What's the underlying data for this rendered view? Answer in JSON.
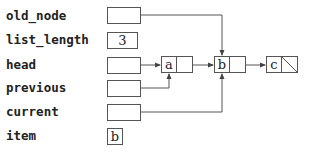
{
  "variables": [
    {
      "name": "old_node",
      "value": "",
      "kind": "pointer",
      "target": "b"
    },
    {
      "name": "list_length",
      "value": "3",
      "kind": "value"
    },
    {
      "name": "head",
      "value": "",
      "kind": "pointer",
      "target": "a"
    },
    {
      "name": "previous",
      "value": "",
      "kind": "pointer",
      "target": "a"
    },
    {
      "name": "current",
      "value": "",
      "kind": "pointer",
      "target": "b"
    },
    {
      "name": "item",
      "value": "b",
      "kind": "value"
    }
  ],
  "nodes": [
    {
      "id": "a",
      "data": "a",
      "next": "b"
    },
    {
      "id": "b",
      "data": "b",
      "next": "c"
    },
    {
      "id": "c",
      "data": "c",
      "next": "null"
    }
  ],
  "colors": {
    "line": "#555555",
    "text": "#222222"
  }
}
